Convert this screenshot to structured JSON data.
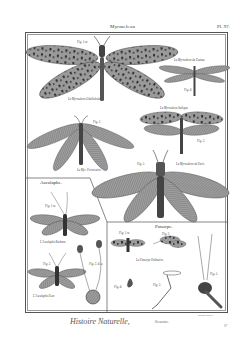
{
  "header": {
    "title": "Myrmeleon",
    "plate_number": "Pl. 97."
  },
  "sections": {
    "ascalaphe": {
      "title": "Ascalaphe."
    },
    "panorpe": {
      "title": "Panorpe."
    }
  },
  "figures": [
    {
      "id": "fig1",
      "fig_label": "Fig. 1.re",
      "caption": "Le Myrmeleon Libelluloide."
    },
    {
      "id": "fig4",
      "fig_label": "Fig. 4.",
      "caption": "Le Myrmeleon de Guinee."
    },
    {
      "id": "fig3",
      "fig_label": "Fig. 3.",
      "caption": "Le Myrmeleon Italique."
    },
    {
      "id": "fig2",
      "fig_label": "Fig. 2.",
      "caption": "Le Myr. Formicaire."
    },
    {
      "id": "fig5",
      "fig_label": "Fig. 5.",
      "caption": "Le Myrmeleon de Paris."
    },
    {
      "id": "asc1",
      "fig_label": "Fig. 1.re",
      "caption": "L'Ascalaphe Barbare."
    },
    {
      "id": "asc2",
      "fig_label": "Fig. 2.",
      "caption": "L'Ascalaphe Ecar."
    },
    {
      "id": "asc3",
      "fig_label": "Fig. 3. 4. a.",
      "caption": ""
    },
    {
      "id": "pan1",
      "fig_label": "Fig. 1.re",
      "caption": "La Panorpe Ordinaire."
    },
    {
      "id": "pan2",
      "fig_label": "Fig. 2.",
      "caption": ""
    },
    {
      "id": "pan3",
      "fig_label": "Fig. 3.",
      "caption": ""
    },
    {
      "id": "pan4",
      "fig_label": "Fig. 4.",
      "caption": ""
    },
    {
      "id": "pan5",
      "fig_label": "Fig. 5.",
      "caption": ""
    }
  ],
  "footer": {
    "title": "Histoire Naturelle,",
    "subtitle": "Insectes.",
    "engraver": "Bénard Direxit",
    "page_number": "97"
  },
  "colors": {
    "paper": "#ffffff",
    "ink": "#3a3a3a",
    "wing": "#8a8a8a"
  }
}
